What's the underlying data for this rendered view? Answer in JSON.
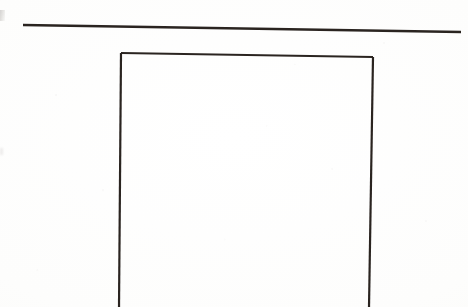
{
  "document": {
    "kind": "scanned-line-drawing",
    "caption": "",
    "background_color": "#fdfdfc",
    "ink_color": "#2a2420"
  },
  "drawing": {
    "title": "",
    "stroke_color": "#2a2420",
    "stroke_width": 2.2,
    "elements": [
      {
        "name": "top-horizontal-rule",
        "type": "line",
        "x1": 23,
        "y1": 25,
        "x2": 461,
        "y2": 32,
        "stroke_width": 2.4
      },
      {
        "name": "rectangle-top-edge",
        "type": "line",
        "x1": 121,
        "y1": 53,
        "x2": 373,
        "y2": 57,
        "stroke_width": 2.2
      },
      {
        "name": "rectangle-left-edge",
        "type": "line",
        "x1": 121,
        "y1": 53,
        "x2": 119,
        "y2": 307,
        "stroke_width": 2.2
      },
      {
        "name": "rectangle-right-edge",
        "type": "line",
        "x1": 373,
        "y1": 57,
        "x2": 369,
        "y2": 307,
        "stroke_width": 2.2
      }
    ],
    "marks": [
      {
        "name": "left-edge-smudge",
        "x": 0,
        "y": 10,
        "width": 5,
        "height": 11
      },
      {
        "name": "left-edge-speck",
        "x": 0,
        "y": 148,
        "width": 3,
        "height": 7
      }
    ]
  },
  "chart_data": {
    "type": "line",
    "title": "",
    "xlabel": "",
    "ylabel": "",
    "series": [
      {
        "name": "top-horizontal-rule",
        "x": [
          23,
          461
        ],
        "y": [
          25,
          32
        ]
      },
      {
        "name": "open-rectangle-outline",
        "x": [
          121,
          121,
          373,
          369
        ],
        "y": [
          307,
          53,
          57,
          307
        ]
      }
    ],
    "xlim": [
      0,
      468
    ],
    "ylim": [
      0,
      307
    ],
    "grid": false,
    "legend": "none",
    "annotations": []
  }
}
